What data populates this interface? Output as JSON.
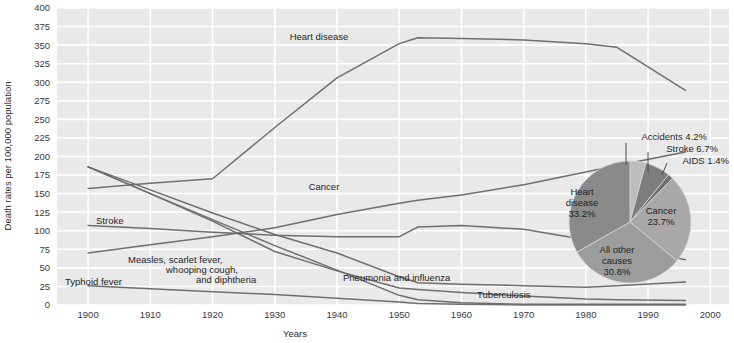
{
  "figure": {
    "background_plot": "#e9e9e9",
    "gridline_color": "#ffffff",
    "line_color": "#6e6e6e"
  },
  "axes": {
    "ylabel": "Death rates per 100,000 population",
    "xlabel": "Years",
    "yticks": [
      "400",
      "375",
      "350",
      "325",
      "300",
      "275",
      "250",
      "225",
      "200",
      "175",
      "150",
      "125",
      "100",
      "75",
      "50",
      "25",
      "0"
    ],
    "xticks": [
      "1900",
      "1910",
      "1920",
      "1930",
      "1940",
      "1950",
      "1960",
      "1970",
      "1980",
      "1990",
      "2000"
    ],
    "ylim": [
      0,
      400
    ],
    "xlim": [
      1895,
      2003
    ],
    "grid": "both"
  },
  "series_labels": {
    "heart_disease": "Heart disease",
    "cancer": "Cancer",
    "stroke": "Stroke",
    "measles": "Measles, scarlet fever,",
    "measles2": "whooping cough,",
    "measles3": "and diphtheria",
    "typhoid": "Typhoid fever",
    "pneumonia": "Pneumonia and influenza",
    "tuberculosis": "Tuberculosis"
  },
  "pie": {
    "slices": [
      {
        "name": "Heart disease",
        "label1": "Heart",
        "label2": "disease",
        "label3": "33.2%",
        "value": 33.2,
        "color": "#8a8a8a"
      },
      {
        "name": "All other causes",
        "label1": "All other",
        "label2": "causes",
        "label3": "30.8%",
        "value": 30.8,
        "color": "#9c9c9c"
      },
      {
        "name": "Cancer",
        "label1": "Cancer",
        "label2": "23.7%",
        "value": 23.7,
        "color": "#a8a8a8"
      },
      {
        "name": "Stroke",
        "label1": "Stroke 6.7%",
        "value": 6.7,
        "color": "#7d7d7d"
      },
      {
        "name": "Accidents",
        "label1": "Accidents 4.2%",
        "value": 4.2,
        "color": "#bdbdbd"
      },
      {
        "name": "AIDS",
        "label1": "AIDS 1.4%",
        "value": 1.4,
        "color": "#6f6f6f"
      }
    ],
    "callouts": [
      "Accidents 4.2%",
      "Stroke 6.7%",
      "AIDS 1.4%"
    ]
  },
  "chart_data": {
    "type": "line",
    "title": "",
    "xlabel": "Years",
    "ylabel": "Death rates per 100,000 population",
    "xlim": [
      1895,
      2003
    ],
    "ylim": [
      0,
      400
    ],
    "grid": true,
    "legend": "inline-annotations",
    "x": [
      1900,
      1910,
      1920,
      1930,
      1940,
      1950,
      1953,
      1960,
      1970,
      1980,
      1985,
      1996
    ],
    "series": [
      {
        "name": "Heart disease",
        "points": [
          [
            1900,
            157
          ],
          [
            1910,
            164
          ],
          [
            1920,
            170
          ],
          [
            1930,
            239
          ],
          [
            1940,
            306
          ],
          [
            1950,
            352
          ],
          [
            1953,
            360
          ],
          [
            1960,
            359
          ],
          [
            1970,
            357
          ],
          [
            1980,
            352
          ],
          [
            1985,
            347
          ],
          [
            1996,
            289
          ]
        ]
      },
      {
        "name": "Cancer",
        "points": [
          [
            1900,
            70
          ],
          [
            1910,
            81
          ],
          [
            1920,
            92
          ],
          [
            1930,
            104
          ],
          [
            1940,
            122
          ],
          [
            1950,
            137
          ],
          [
            1953,
            141
          ],
          [
            1960,
            148
          ],
          [
            1970,
            162
          ],
          [
            1980,
            179
          ],
          [
            1985,
            188
          ],
          [
            1996,
            206
          ]
        ]
      },
      {
        "name": "Stroke",
        "points": [
          [
            1900,
            107
          ],
          [
            1910,
            103
          ],
          [
            1920,
            98
          ],
          [
            1930,
            94
          ],
          [
            1940,
            92
          ],
          [
            1950,
            92
          ],
          [
            1953,
            105
          ],
          [
            1960,
            107
          ],
          [
            1970,
            102
          ],
          [
            1980,
            88
          ],
          [
            1985,
            80
          ],
          [
            1996,
            61
          ]
        ]
      },
      {
        "name": "Pneumonia and influenza",
        "points": [
          [
            1900,
            186
          ],
          [
            1910,
            155
          ],
          [
            1920,
            124
          ],
          [
            1930,
            95
          ],
          [
            1940,
            70
          ],
          [
            1950,
            38
          ],
          [
            1953,
            30
          ],
          [
            1960,
            28
          ],
          [
            1970,
            26
          ],
          [
            1980,
            24
          ],
          [
            1985,
            26
          ],
          [
            1996,
            31
          ]
        ]
      },
      {
        "name": "Measles, scarlet fever, whooping cough, and diphtheria",
        "points": [
          [
            1900,
            186
          ],
          [
            1910,
            150
          ],
          [
            1920,
            115
          ],
          [
            1930,
            80
          ],
          [
            1940,
            47
          ],
          [
            1950,
            13
          ],
          [
            1953,
            7
          ],
          [
            1960,
            3
          ],
          [
            1970,
            1
          ],
          [
            1980,
            1
          ],
          [
            1985,
            1
          ],
          [
            1996,
            1
          ]
        ]
      },
      {
        "name": "Tuberculosis",
        "points": [
          [
            1900,
            186
          ],
          [
            1910,
            150
          ],
          [
            1920,
            113
          ],
          [
            1930,
            72
          ],
          [
            1940,
            46
          ],
          [
            1950,
            23
          ],
          [
            1953,
            21
          ],
          [
            1960,
            17
          ],
          [
            1970,
            12
          ],
          [
            1980,
            8
          ],
          [
            1985,
            7
          ],
          [
            1996,
            6
          ]
        ]
      },
      {
        "name": "Typhoid fever",
        "points": [
          [
            1900,
            26
          ],
          [
            1910,
            22
          ],
          [
            1920,
            18
          ],
          [
            1930,
            14
          ],
          [
            1940,
            9
          ],
          [
            1950,
            4
          ],
          [
            1953,
            2
          ],
          [
            1960,
            1
          ],
          [
            1970,
            0
          ],
          [
            1980,
            0
          ],
          [
            1985,
            0
          ],
          [
            1996,
            0
          ]
        ]
      }
    ]
  },
  "pie_chart_data": {
    "type": "pie",
    "title": "",
    "labels": [
      "Heart disease",
      "Cancer",
      "All other causes",
      "Stroke",
      "Accidents",
      "AIDS"
    ],
    "values": [
      33.2,
      23.7,
      30.8,
      6.7,
      4.2,
      1.4
    ],
    "unit": "%"
  }
}
